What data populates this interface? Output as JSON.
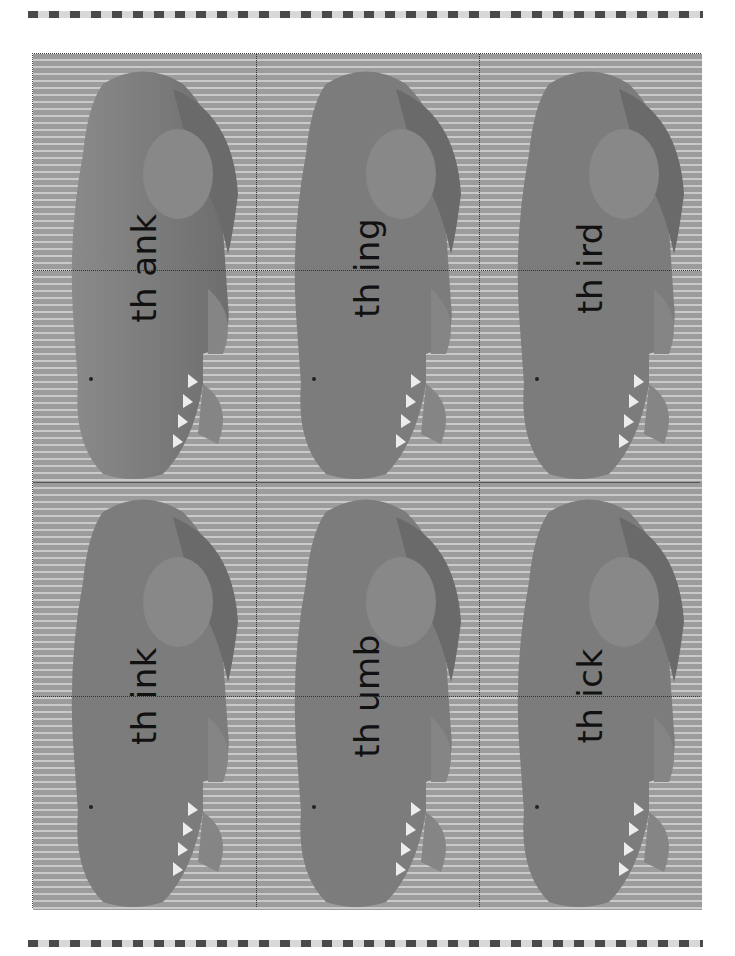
{
  "page": {
    "background_color": "#ffffff",
    "card_background": "#9c9c9c",
    "card_stripe": "#c9c9c9",
    "croc_color": "#7a7a7a"
  },
  "cards": [
    {
      "prefix": "th",
      "ending": "ank",
      "word": "thank"
    },
    {
      "prefix": "th",
      "ending": "ing",
      "word": "thing"
    },
    {
      "prefix": "th",
      "ending": "ird",
      "word": "third"
    },
    {
      "prefix": "th",
      "ending": "ink",
      "word": "think"
    },
    {
      "prefix": "th",
      "ending": "umb",
      "word": "thumb"
    },
    {
      "prefix": "th",
      "ending": "ick",
      "word": "thick"
    }
  ]
}
